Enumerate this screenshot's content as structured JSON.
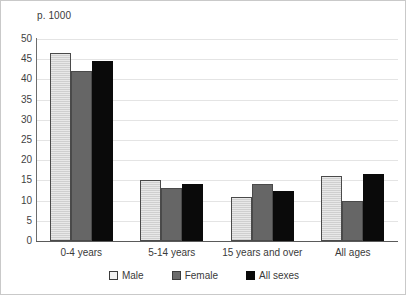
{
  "chart_data": {
    "type": "bar",
    "title": "p. 1000",
    "xlabel": "",
    "ylabel": "",
    "ylim": [
      0,
      50
    ],
    "ytick_step": 5,
    "yticks": [
      50,
      45,
      40,
      35,
      30,
      25,
      20,
      15,
      10,
      5,
      0
    ],
    "grid": true,
    "legend_position": "bottom",
    "categories": [
      "0-4 years",
      "5-14 years",
      "15 years and over",
      "All ages"
    ],
    "series": [
      {
        "name": "Male",
        "color": "#dcdcdc",
        "values": [
          46.5,
          15.0,
          11.0,
          16.0
        ]
      },
      {
        "name": "Female",
        "color": "#666666",
        "values": [
          42.0,
          13.0,
          14.0,
          10.0
        ]
      },
      {
        "name": "All sexes",
        "color": "#0a0a0a",
        "values": [
          44.5,
          14.0,
          12.5,
          16.5
        ]
      }
    ]
  },
  "chart": {
    "title": "p. 1000"
  },
  "axis": {
    "y_tick_labels": [
      "50",
      "45",
      "40",
      "35",
      "30",
      "25",
      "20",
      "15",
      "10",
      "5",
      "0"
    ],
    "x_category_labels": [
      "0-4 years",
      "5-14 years",
      "15 years and over",
      "All ages"
    ]
  },
  "legend": {
    "items": [
      {
        "label": "Male",
        "swatch": "male-swatch-icon"
      },
      {
        "label": "Female",
        "swatch": "female-swatch-icon"
      },
      {
        "label": "All sexes",
        "swatch": "all-sexes-swatch-icon"
      }
    ]
  }
}
